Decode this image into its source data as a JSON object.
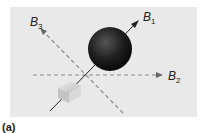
{
  "figure": {
    "labels": {
      "b1": {
        "main": "B",
        "sub": "1"
      },
      "b2": {
        "main": "B",
        "sub": "2"
      },
      "b3": {
        "main": "B",
        "sub": "3"
      }
    },
    "caption": "(a)",
    "colors": {
      "panel": "#e9e9e9",
      "sphere": "#1e1e1e",
      "dashed": "#8a8a8a",
      "cube": "#cfcfcf"
    }
  }
}
